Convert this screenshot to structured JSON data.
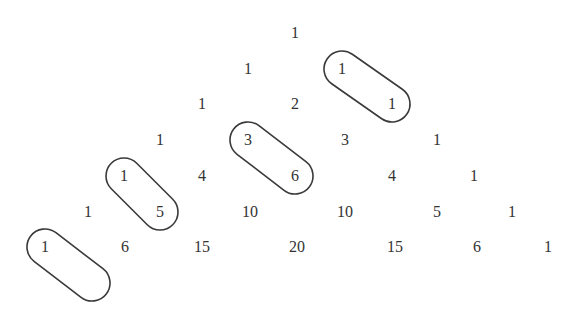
{
  "rows": [
    [
      1
    ],
    [
      1,
      1
    ],
    [
      1,
      2,
      1
    ],
    [
      1,
      3,
      3,
      1
    ],
    [
      1,
      4,
      6,
      4,
      1
    ],
    [
      1,
      5,
      10,
      10,
      5,
      1
    ],
    [
      1,
      6,
      15,
      20,
      15,
      6,
      1
    ]
  ],
  "layout": {
    "row_y": [
      33,
      69,
      104,
      140,
      176,
      212,
      247
    ],
    "row_x": [
      [
        295
      ],
      [
        248,
        342
      ],
      [
        202,
        295,
        392
      ],
      [
        160,
        248,
        345,
        437
      ],
      [
        124,
        202,
        295,
        392,
        474
      ],
      [
        88,
        160,
        250,
        345,
        437,
        512
      ],
      [
        45,
        125,
        202,
        297,
        395,
        477,
        548
      ]
    ]
  },
  "highlights": [
    {
      "label": "diagonal-1-1",
      "cells": [
        [
          1,
          1
        ],
        [
          2,
          2
        ]
      ],
      "x1": 342,
      "y1": 69,
      "x2": 392,
      "y2": 104
    },
    {
      "label": "diagonal-3-6",
      "cells": [
        [
          3,
          1
        ],
        [
          4,
          2
        ]
      ],
      "x1": 248,
      "y1": 140,
      "x2": 295,
      "y2": 176
    },
    {
      "label": "diagonal-1-5",
      "cells": [
        [
          4,
          0
        ],
        [
          5,
          1
        ]
      ],
      "x1": 124,
      "y1": 176,
      "x2": 160,
      "y2": 212
    },
    {
      "label": "diagonal-1-empty",
      "cells": [
        [
          6,
          0
        ]
      ],
      "x1": 45,
      "y1": 247,
      "x2": 92,
      "y2": 283
    }
  ],
  "colors": {
    "text": "#333333",
    "stroke": "#3a3a3a",
    "background": "#ffffff"
  }
}
